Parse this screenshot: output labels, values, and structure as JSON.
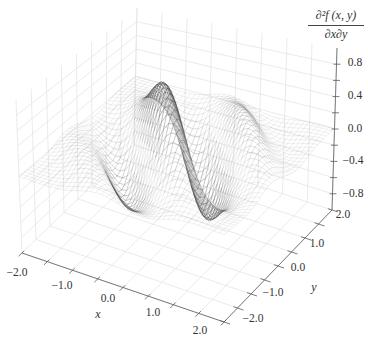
{
  "chart_data": {
    "type": "surface3d",
    "title": "",
    "xlabel": "x",
    "ylabel": "y",
    "zlabel": {
      "numerator": "∂²f (x, y)",
      "denominator": "∂x∂y"
    },
    "x_range": [
      -2.0,
      2.0
    ],
    "y_range": [
      -2.0,
      2.0
    ],
    "z_range": [
      -1.0,
      1.0
    ],
    "x_ticks": [
      -2.0,
      -1.0,
      0.0,
      1.0,
      2.0
    ],
    "x_tick_labels": [
      "−2.0",
      "−1.0",
      "0.0",
      "1.0",
      "2.0"
    ],
    "y_ticks": [
      -2.0,
      -1.0,
      0.0,
      1.0,
      2.0
    ],
    "y_tick_labels": [
      "−2.0",
      "−1.0",
      "0.0",
      "1.0",
      "2.0"
    ],
    "z_ticks": [
      -0.8,
      -0.4,
      0.0,
      0.4,
      0.8
    ],
    "z_tick_labels": [
      "−0.8",
      "−0.4",
      "0.0",
      "0.4",
      "0.8"
    ],
    "minor_tick_step": {
      "x": 0.5,
      "y": 0.5,
      "z": 0.2
    },
    "grid": true,
    "legend": null,
    "render": {
      "style": "wireframe",
      "mesh_lines": 41,
      "line_color": "#3a3a3a",
      "pane_color": "#ffffff",
      "grid_color": "#e3e3e3",
      "axis_color": "#5a5a5a"
    },
    "surface_estimate": {
      "form": "z = A·sin(k·(x·cosθ + y·sinθ) + φ)·exp(−(x²+y²)/s)",
      "A": 0.93,
      "k": 4.19,
      "theta_deg": 42,
      "phi": 2.6,
      "s": 1.63
    },
    "features": [
      {
        "type": "peak",
        "x": -0.33,
        "y": 0.0,
        "z": 0.87
      },
      {
        "type": "trough",
        "x": 0.38,
        "y": 0.34,
        "z": -0.8
      },
      {
        "type": "peak",
        "x": 0.93,
        "y": 0.84,
        "z": 0.33
      },
      {
        "type": "flat-edges",
        "z": 0.0
      }
    ]
  }
}
